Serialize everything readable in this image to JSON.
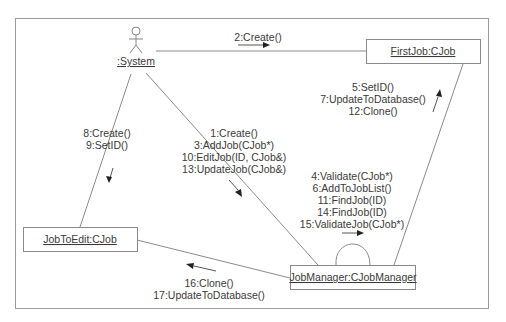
{
  "diagram": {
    "type": "UML collaboration diagram",
    "actor": {
      "name": ":System",
      "icon": "stick-figure-actor-icon"
    },
    "objects": {
      "first_job": ":FirstJob:CJob",
      "job_to_edit": "JobToEdit:CJob",
      "job_manager": "JobManager:CJobManager"
    },
    "object_labels": {
      "first_job": "FirstJob:CJob",
      "job_to_edit": "JobToEdit:CJob",
      "job_manager": "JobManager:CJobManager"
    },
    "links": [
      {
        "from": ":System",
        "to": "FirstJob:CJob",
        "messages": [
          "2:Create()"
        ]
      },
      {
        "from": ":System",
        "to": "JobToEdit:CJob",
        "messages": [
          "8:Create()",
          "9:SetID()"
        ]
      },
      {
        "from": ":System",
        "to": "JobManager:CJobManager",
        "messages": [
          "1:Create()",
          "3:AddJob(CJob*)",
          "10:EditJob(ID, CJob&)",
          "13:UpdateJob(CJob&)"
        ]
      },
      {
        "from": "JobManager:CJobManager",
        "to": "FirstJob:CJob",
        "messages": [
          "5:SetID()",
          "7:UpdateToDatabase()",
          "12:Clone()"
        ]
      },
      {
        "from": "JobManager:CJobManager",
        "to": "JobManager:CJobManager",
        "messages": [
          "4:Validate(CJob*)",
          "6:AddToJobList()",
          "11:FindJob(ID)",
          "14:FindJob(ID)",
          "15:ValidateJob(CJob*)"
        ]
      },
      {
        "from": "JobManager:CJobManager",
        "to": "JobToEdit:CJob",
        "messages": [
          "16:Clone()",
          "17:UpdateToDatabase()"
        ]
      }
    ]
  }
}
